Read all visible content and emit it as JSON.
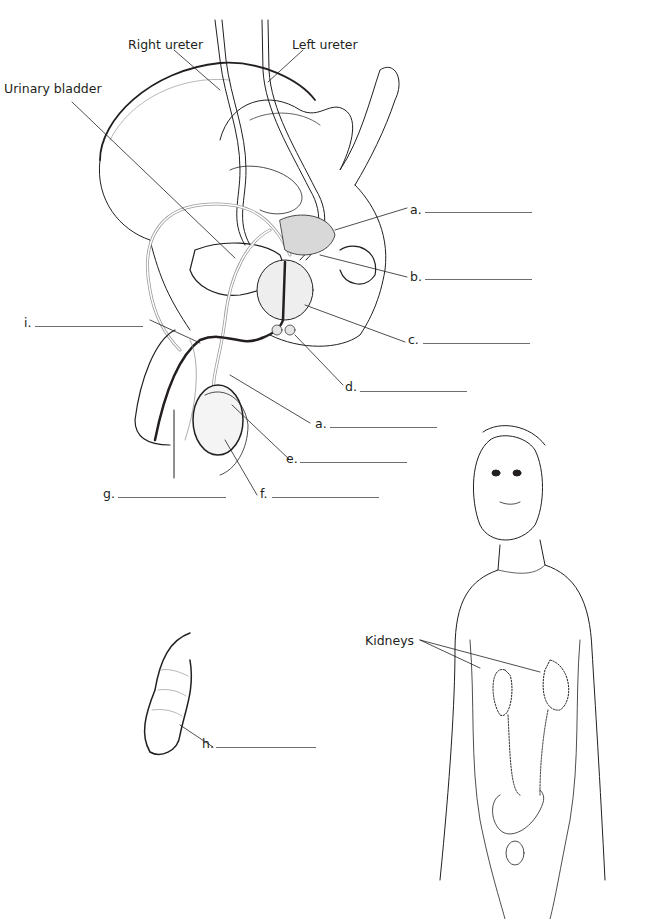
{
  "diagram": {
    "named_labels": {
      "right_ureter": "Right ureter",
      "left_ureter": "Left ureter",
      "urinary_bladder": "Urinary bladder",
      "kidneys": "Kidneys"
    },
    "blank_labels": [
      {
        "key": "a",
        "text": "a.",
        "position": "upper right, seminal vesicle/ductus region"
      },
      {
        "key": "b",
        "text": "b.",
        "position": "right of seminal vesicle"
      },
      {
        "key": "c",
        "text": "c.",
        "position": "right of prostate"
      },
      {
        "key": "d",
        "text": "d.",
        "position": "below prostate"
      },
      {
        "key": "a2",
        "text": "a.",
        "position": "ductus deferens, lower"
      },
      {
        "key": "e",
        "text": "e.",
        "position": "epididymis"
      },
      {
        "key": "f",
        "text": "f.",
        "position": "testis"
      },
      {
        "key": "g",
        "text": "g.",
        "position": "scrotum/penis region"
      },
      {
        "key": "i",
        "text": "i.",
        "position": "urethra region, left"
      },
      {
        "key": "h",
        "text": "h.",
        "position": "uncircumcised penis, foreskin"
      }
    ]
  }
}
